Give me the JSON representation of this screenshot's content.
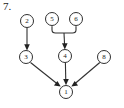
{
  "figure": {
    "label": "7.",
    "type": "directed-graph",
    "width": 124,
    "height": 108,
    "background_color": "#ffffff",
    "stroke_color": "#303030",
    "text_color": "#1a1a1a"
  },
  "graph_data": {
    "type": "diagram",
    "title": "7.",
    "directed": true,
    "nodes": [
      {
        "id": "2",
        "label": "2",
        "x": 27,
        "y": 21,
        "r": 6.5
      },
      {
        "id": "5",
        "label": "5",
        "x": 52,
        "y": 19,
        "r": 6.5
      },
      {
        "id": "6",
        "label": "6",
        "x": 76,
        "y": 19,
        "r": 6.5
      },
      {
        "id": "3",
        "label": "3",
        "x": 26,
        "y": 57,
        "r": 6.5
      },
      {
        "id": "4",
        "label": "4",
        "x": 65,
        "y": 56,
        "r": 6.5
      },
      {
        "id": "8",
        "label": "8",
        "x": 104,
        "y": 57,
        "r": 6.5
      },
      {
        "id": "1",
        "label": "1",
        "x": 66,
        "y": 92,
        "r": 6.5
      }
    ],
    "edges": [
      {
        "from": "2",
        "to": "3",
        "style": "straight-arrow"
      },
      {
        "from": "5",
        "to": "4",
        "style": "merged-bracket-arrow"
      },
      {
        "from": "6",
        "to": "4",
        "style": "merged-bracket-arrow"
      },
      {
        "from": "3",
        "to": "1",
        "style": "straight-arrow"
      },
      {
        "from": "4",
        "to": "1",
        "style": "straight-arrow"
      },
      {
        "from": "8",
        "to": "1",
        "style": "straight-arrow"
      }
    ],
    "merge_junction": {
      "x": 64,
      "y": 33,
      "connects": [
        "5",
        "6"
      ],
      "target": "4"
    }
  }
}
